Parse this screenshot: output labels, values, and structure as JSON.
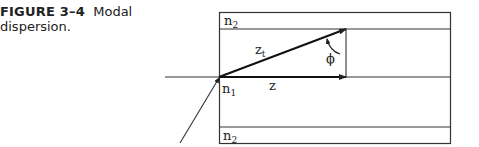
{
  "caption": {
    "figure_number": "FIGURE 3–4",
    "text": "Modal dispersion."
  },
  "diagram": {
    "labels": {
      "cladding_top": {
        "base": "n",
        "sub": "2"
      },
      "core": {
        "base": "n",
        "sub": "1"
      },
      "cladding_bottom": {
        "base": "n",
        "sub": "2"
      },
      "axial_path": "z",
      "zigzag_path": {
        "base": "z",
        "sub": "t"
      },
      "angle": "ϕ"
    },
    "colors": {
      "line": "#222222",
      "background": "#ffffff"
    }
  }
}
